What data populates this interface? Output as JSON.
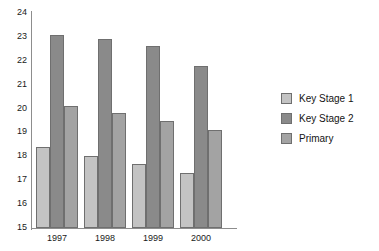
{
  "chart_data": {
    "type": "bar",
    "title": "",
    "xlabel": "",
    "ylabel": "",
    "categories": [
      "1997",
      "1998",
      "1999",
      "2000"
    ],
    "series": [
      {
        "name": "Key Stage 1",
        "color": "#c3c3c3",
        "values": [
          18.4,
          18.0,
          17.7,
          17.3
        ]
      },
      {
        "name": "Key Stage 2",
        "color": "#8a8a8a",
        "values": [
          23.1,
          22.9,
          22.6,
          21.8
        ]
      },
      {
        "name": "Primary",
        "color": "#a3a3a3",
        "values": [
          20.1,
          19.8,
          19.5,
          19.1
        ]
      }
    ],
    "ylim": [
      15,
      24
    ],
    "yticks": [
      15,
      16,
      17,
      18,
      19,
      20,
      21,
      22,
      23,
      24
    ],
    "ytick_labels": [
      "15",
      "16",
      "17",
      "18",
      "19",
      "20",
      "21",
      "22",
      "23",
      "24"
    ],
    "grid": false,
    "legend_position": "right"
  },
  "legend": {
    "entries": [
      {
        "label": "Key Stage 1"
      },
      {
        "label": "Key Stage 2"
      },
      {
        "label": "Primary"
      }
    ]
  },
  "axes": {
    "y_axis_name": "y-axis",
    "x_axis_name": "x-axis"
  }
}
